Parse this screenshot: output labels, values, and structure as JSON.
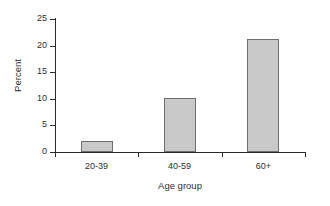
{
  "chart_data": {
    "type": "bar",
    "title": "",
    "subtitle": "",
    "categories": [
      "20-39",
      "40-59",
      "60+"
    ],
    "values": [
      2.1,
      10.2,
      21.2
    ],
    "series": [
      {
        "name": "Percent",
        "values": [
          2.1,
          10.2,
          21.2
        ]
      }
    ],
    "xlabel": "Age group",
    "ylabel": "Percent",
    "ylim": [
      0,
      25
    ],
    "yticks": [
      0,
      5,
      10,
      15,
      20,
      25
    ],
    "ytick_labels": [
      "0",
      "5",
      "10",
      "15",
      "20",
      "25"
    ],
    "grid": false,
    "legend": false,
    "legend_position": "none",
    "bar_fill_color": "#c9c9c9",
    "bar_edge_color": "#6e6e6e",
    "axis_color": "#2b2b2b",
    "background_color": "#ffffff",
    "text_color": "#2e2e2e",
    "annotations": []
  }
}
